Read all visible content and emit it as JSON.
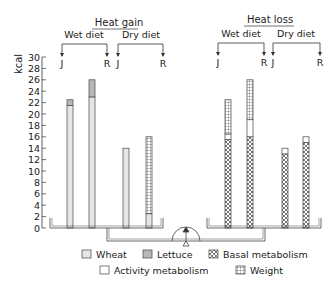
{
  "chart_data": {
    "type": "bar",
    "title": "",
    "ylabel": "kcal",
    "ylim": [
      0,
      30
    ],
    "yticks": [
      0,
      2,
      4,
      6,
      8,
      10,
      12,
      14,
      16,
      18,
      20,
      22,
      24,
      26,
      28,
      30
    ],
    "groups": [
      {
        "label": "Heat gain",
        "subgroups": [
          {
            "label": "Wet diet",
            "bars": [
              {
                "label": "J",
                "segments": [
                  {
                    "type": "Wheat",
                    "value": 21.5
                  },
                  {
                    "type": "Lettuce",
                    "value": 1.0
                  }
                ]
              },
              {
                "label": "R",
                "segments": [
                  {
                    "type": "Wheat",
                    "value": 23.0
                  },
                  {
                    "type": "Lettuce",
                    "value": 3.0
                  }
                ]
              }
            ]
          },
          {
            "label": "Dry diet",
            "bars": [
              {
                "label": "J",
                "segments": [
                  {
                    "type": "Wheat",
                    "value": 14.0
                  }
                ]
              },
              {
                "label": "R",
                "segments": [
                  {
                    "type": "Wheat",
                    "value": 2.5
                  },
                  {
                    "type": "Weight",
                    "value": 13.5
                  }
                ]
              }
            ]
          }
        ]
      },
      {
        "label": "Heat loss",
        "subgroups": [
          {
            "label": "Wet diet",
            "bars": [
              {
                "label": "J",
                "segments": [
                  {
                    "type": "Basal metabolism",
                    "value": 15.5
                  },
                  {
                    "type": "Activity metabolism",
                    "value": 1.0
                  },
                  {
                    "type": "Weight",
                    "value": 6.0
                  }
                ]
              },
              {
                "label": "R",
                "segments": [
                  {
                    "type": "Basal metabolism",
                    "value": 16.0
                  },
                  {
                    "type": "Activity metabolism",
                    "value": 3.0
                  },
                  {
                    "type": "Weight",
                    "value": 7.0
                  }
                ]
              }
            ]
          },
          {
            "label": "Dry diet",
            "bars": [
              {
                "label": "J",
                "segments": [
                  {
                    "type": "Basal metabolism",
                    "value": 13.0
                  },
                  {
                    "type": "Activity metabolism",
                    "value": 1.0
                  }
                ]
              },
              {
                "label": "R",
                "segments": [
                  {
                    "type": "Basal metabolism",
                    "value": 15.0
                  },
                  {
                    "type": "Activity metabolism",
                    "value": 1.0
                  }
                ]
              }
            ]
          }
        ]
      }
    ],
    "legend": [
      "Wheat",
      "Lettuce",
      "Basal metabolism",
      "Activity metabolism",
      "Weight"
    ]
  },
  "labels": {
    "heat_gain": "Heat gain",
    "heat_loss": "Heat loss",
    "wet_diet": "Wet diet",
    "dry_diet": "Dry diet",
    "j": "J",
    "r": "R",
    "ylabel": "kcal"
  },
  "legend": {
    "wheat": "Wheat",
    "lettuce": "Lettuce",
    "basal": "Basal metabolism",
    "activity": "Activity metabolism",
    "weight": "Weight"
  },
  "colors": {
    "wheat": "#e6e6e6",
    "lettuce": "#b8b8b8",
    "activity": "#ffffff",
    "line": "#333333"
  }
}
